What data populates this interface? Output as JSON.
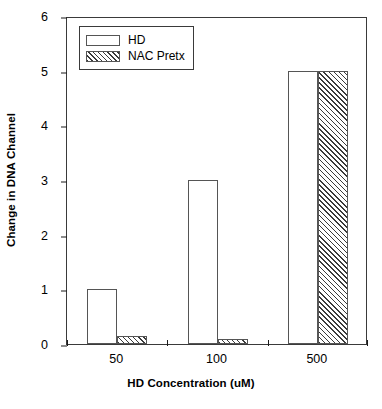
{
  "chart_data": {
    "type": "bar",
    "title": "",
    "subtitle": "",
    "xlabel": "HD Concentration (uM)",
    "ylabel": "Change in DNA Channel",
    "categories": [
      "50",
      "100",
      "500"
    ],
    "series": [
      {
        "name": "HD",
        "values": [
          1,
          3,
          5
        ],
        "fill": "white",
        "edge": "#555555"
      },
      {
        "name": "NAC Pretx",
        "values": [
          0.15,
          0.1,
          5
        ],
        "fill": "diagonal-hatch",
        "edge": "#555555"
      }
    ],
    "ylim": [
      0,
      6
    ],
    "yticks": [
      0,
      1,
      2,
      3,
      4,
      5,
      6
    ],
    "ytick_labels": [
      "0",
      "1",
      "2",
      "3",
      "4",
      "5",
      "6"
    ],
    "grid": false,
    "legend_position": "upper left",
    "legend_entries": [
      "HD",
      "NAC Pretx"
    ],
    "frame": "full-box",
    "annotations": []
  },
  "legend": {
    "items": [
      {
        "label": "HD",
        "swatch": "open-rectangle-swatch"
      },
      {
        "label": "NAC Pretx",
        "swatch": "hatched-rectangle-swatch"
      }
    ]
  },
  "axes": {
    "y_title": "Change in DNA Channel",
    "x_title": "HD Concentration (uM)"
  },
  "colors": {
    "axis": "#1a1a1a",
    "frame": "#3a3a3a",
    "bar_edge": "#555555",
    "hatch": "#3a3a3a",
    "background": "#ffffff"
  }
}
